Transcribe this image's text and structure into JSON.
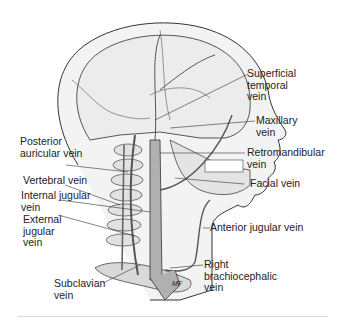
{
  "figure": {
    "labels": {
      "superficial_temporal": "Superficial\ntemporal\nvein",
      "maxillary": "Maxillary\nvein",
      "retromandibular": "Retromandibular\nvein",
      "facial": "Facial vein",
      "posterior_auricular": "Posterior\nauricular vein",
      "vertebral": "Vertebral vein",
      "internal_jugular": "Internal jugular\nvein",
      "external_jugular": "External\njugular\nvein",
      "anterior_jugular": "Anterior jugular vein",
      "right_brachiocephalic": "Right\nbrachiocephalic\nvein",
      "subclavian": "Subclavian\nvein",
      "artist_mark": "MF"
    },
    "colors": {
      "outline": "#333333",
      "skull_fill": "#ececec",
      "vein_fill": "#b0b0b0",
      "text": "#222222",
      "rule": "#d8d8d8"
    }
  }
}
